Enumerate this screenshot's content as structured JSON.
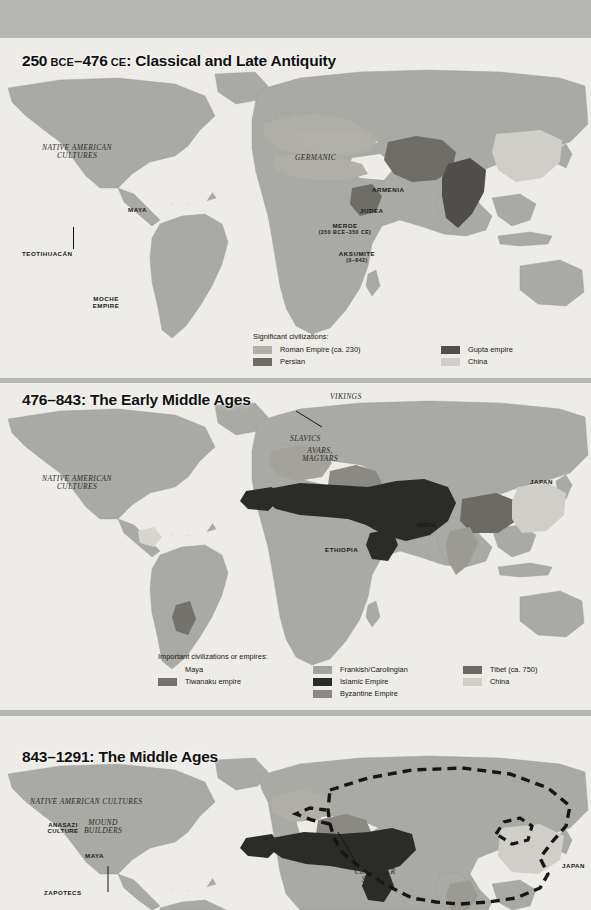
{
  "page": {
    "background_color": "#b6b6b4",
    "paper_color": "#edece8",
    "land_color": "#a9a9a5"
  },
  "palette": {
    "roman": "#b0afa8",
    "persian": "#6d6c66",
    "gupta": "#4f4e4a",
    "china": "#cfcec8",
    "maya": "#d6d5cf",
    "tiwanaku": "#73726c",
    "frankish": "#a3a29b",
    "islamic": "#2b2b28",
    "byzantine": "#8a8983",
    "tibet": "#6b6a64",
    "mongol_outline": "#17170f"
  },
  "maps": [
    {
      "id": "map-classical-late-antiquity",
      "title_parts": {
        "start_year": "250",
        "start_era": "BCE",
        "dash": "–",
        "end_year": "476",
        "end_era": "CE",
        "name": ": Classical and Late Antiquity"
      },
      "title_plain": "250 BCE–476 CE: Classical and Late Antiquity",
      "labels": [
        {
          "text": "NATIVE AMERICAN",
          "text2": "CULTURES",
          "style": "serif"
        },
        {
          "text": "MAYA",
          "style": "caps"
        },
        {
          "text": "TEOTIHUACÁN",
          "style": "caps"
        },
        {
          "text": "MOCHE",
          "text2": "EMPIRE",
          "style": "caps"
        },
        {
          "text": "GERMANIC",
          "style": "serif"
        },
        {
          "text": "ARMENIA",
          "style": "caps"
        },
        {
          "text": "JUDEA",
          "style": "caps"
        },
        {
          "text": "MEROE",
          "text2": "(350 BCE–350 CE)",
          "style": "caps"
        },
        {
          "text": "AKSUMITE",
          "text2": "(0–842)",
          "style": "caps"
        }
      ],
      "legend": {
        "title": "Significant civilizations:",
        "columns": [
          {
            "items": [
              {
                "label": "Roman Empire (ca. 230)",
                "color": "#b0afa8"
              },
              {
                "label": "Persian",
                "color": "#6d6c66"
              }
            ]
          },
          {
            "items": [
              {
                "label": "Gupta empire",
                "color": "#4f4e4a"
              },
              {
                "label": "China",
                "color": "#cfcec8"
              }
            ]
          }
        ]
      }
    },
    {
      "id": "map-early-middle-ages",
      "title_parts": {
        "start_year": "476",
        "start_era": "",
        "dash": "–",
        "end_year": "843",
        "end_era": "",
        "name": ": The Early Middle Ages"
      },
      "title_plain": "476–843: The Early Middle Ages",
      "labels": [
        {
          "text": "NATIVE AMERICAN",
          "text2": "CULTURES",
          "style": "serif"
        },
        {
          "text": "VIKINGS",
          "style": "serif"
        },
        {
          "text": "SLAVICS",
          "style": "serif"
        },
        {
          "text": "AVARS,",
          "text2": "MAGYARS",
          "style": "serif"
        },
        {
          "text": "ETHIOPIA",
          "style": "caps"
        },
        {
          "text": "INDIA",
          "style": "caps"
        },
        {
          "text": "JAPAN",
          "style": "caps"
        }
      ],
      "legend": {
        "title": "Important civilizations or empires:",
        "columns": [
          {
            "items": [
              {
                "label": "Maya",
                "color": ""
              },
              {
                "label": "Tiwanaku empire",
                "color": "#73726c"
              }
            ]
          },
          {
            "items": [
              {
                "label": "Frankish/Carolingian",
                "color": "#a3a29b"
              },
              {
                "label": "Islamic Empire",
                "color": "#2b2b28"
              },
              {
                "label": "Byzantine Empire",
                "color": "#8a8983"
              }
            ]
          },
          {
            "items": [
              {
                "label": "Tibet (ca. 750)",
                "color": "#6b6a64"
              },
              {
                "label": "China",
                "color": "#cfcec8"
              }
            ]
          }
        ]
      }
    },
    {
      "id": "map-middle-ages",
      "title_parts": {
        "start_year": "843",
        "start_era": "",
        "dash": "–",
        "end_year": "1291",
        "end_era": "",
        "name": ": The Middle Ages"
      },
      "title_plain": "843–1291: The Middle Ages",
      "labels": [
        {
          "text": "NATIVE AMERICAN CULTURES",
          "style": "serif"
        },
        {
          "text": "ANASAZI",
          "text2": "CULTURE",
          "style": "caps"
        },
        {
          "text": "MOUND",
          "text2": "BUILDERS",
          "style": "serif"
        },
        {
          "text": "MAYA",
          "style": "caps"
        },
        {
          "text": "ZAPOTECS",
          "style": "caps"
        },
        {
          "text": "CRUSADER",
          "text2": "STATES",
          "style": "serif"
        },
        {
          "text": "JAPAN",
          "style": "caps"
        }
      ],
      "legend": null
    }
  ]
}
